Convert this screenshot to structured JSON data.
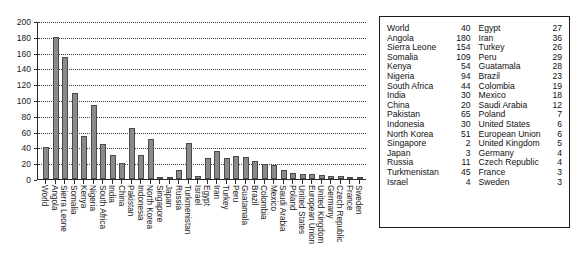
{
  "chart_data": {
    "type": "bar",
    "title": "",
    "xlabel": "",
    "ylabel": "",
    "ylim": [
      0,
      200
    ],
    "ytick_step": 20,
    "yticks": [
      0,
      20,
      40,
      60,
      80,
      100,
      120,
      140,
      160,
      180,
      200
    ],
    "grid": true,
    "grid_style": "dotted-horizontal",
    "legend": "none",
    "bar_color": "#8a8a8a",
    "bar_edge_color": "#4a4a4a",
    "categories": [
      "World",
      "Angola",
      "Sierra Leone",
      "Somalia",
      "Kenya",
      "Nigeria",
      "South Africa",
      "India",
      "China",
      "Pakistan",
      "Indonesia",
      "North Korea",
      "Singapore",
      "Japan",
      "Russia",
      "Turkmenistan",
      "Israel",
      "Egypt",
      "Iran",
      "Turkey",
      "Peru",
      "Guatamala",
      "Brazil",
      "Colombia",
      "Mexico",
      "Saudi Arabia",
      "Poland",
      "United States",
      "European Union",
      "United Kingdom",
      "Germany",
      "Czech Republic",
      "France",
      "Sweden"
    ],
    "values": [
      40,
      180,
      154,
      109,
      54,
      94,
      44,
      30,
      20,
      65,
      30,
      51,
      2,
      3,
      11,
      45,
      4,
      27,
      36,
      26,
      29,
      28,
      23,
      19,
      18,
      12,
      7,
      6,
      6,
      5,
      4,
      4,
      3,
      3
    ]
  },
  "table": {
    "left_column": [
      {
        "name": "World",
        "value": "40"
      },
      {
        "name": "Angola",
        "value": "180"
      },
      {
        "name": "Sierra Leone",
        "value": "154"
      },
      {
        "name": "Somalia",
        "value": "109"
      },
      {
        "name": "Kenya",
        "value": "54"
      },
      {
        "name": "Nigeria",
        "value": "94"
      },
      {
        "name": "South Africa",
        "value": "44"
      },
      {
        "name": "India",
        "value": "30"
      },
      {
        "name": "China",
        "value": "20"
      },
      {
        "name": "Pakistan",
        "value": "65"
      },
      {
        "name": "Indonesia",
        "value": "30"
      },
      {
        "name": "North Korea",
        "value": "51"
      },
      {
        "name": "Singapore",
        "value": "2"
      },
      {
        "name": "Japan",
        "value": "3"
      },
      {
        "name": "Russia",
        "value": "11"
      },
      {
        "name": "Turkmenistan",
        "value": "45"
      },
      {
        "name": "Israel",
        "value": "4"
      }
    ],
    "right_column": [
      {
        "name": "Egypt",
        "value": "27"
      },
      {
        "name": "Iran",
        "value": "36"
      },
      {
        "name": "Turkey",
        "value": "26"
      },
      {
        "name": "Peru",
        "value": "29"
      },
      {
        "name": "Guatamala",
        "value": "28"
      },
      {
        "name": "Brazil",
        "value": "23"
      },
      {
        "name": "Colombia",
        "value": "19"
      },
      {
        "name": "Mexico",
        "value": "18"
      },
      {
        "name": "Saudi Arabia",
        "value": "12"
      },
      {
        "name": "Poland",
        "value": "7"
      },
      {
        "name": "United States",
        "value": "6"
      },
      {
        "name": "European Union",
        "value": "6"
      },
      {
        "name": "United Kingdom",
        "value": "5"
      },
      {
        "name": "Germany",
        "value": "4"
      },
      {
        "name": "Czech Republic",
        "value": "4"
      },
      {
        "name": "France",
        "value": "3"
      },
      {
        "name": "Sweden",
        "value": "3"
      }
    ]
  }
}
